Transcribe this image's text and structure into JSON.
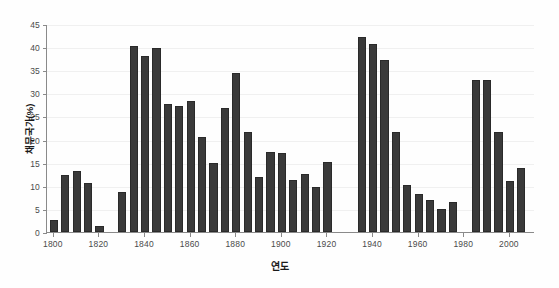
{
  "chart_data": {
    "type": "bar",
    "title": "",
    "xlabel": "연도",
    "ylabel": "채무국가(%)",
    "xlim": [
      1797,
      2011
    ],
    "ylim": [
      0,
      45
    ],
    "ytick_values": [
      0,
      5,
      10,
      15,
      20,
      25,
      30,
      35,
      40,
      45
    ],
    "ytick_labels": [
      "0",
      "5",
      "10",
      "15",
      "20",
      "25",
      "30",
      "35",
      "40",
      "45"
    ],
    "xtick_values": [
      1800,
      1820,
      1840,
      1860,
      1880,
      1900,
      1920,
      1940,
      1960,
      1980,
      2000
    ],
    "xtick_labels": [
      "1800",
      "1820",
      "1840",
      "1860",
      "1880",
      "1900",
      "1920",
      "1940",
      "1960",
      "1980",
      "2000"
    ],
    "grid": "horizontal",
    "legend": "none",
    "bar_color": "#3a3a3a",
    "x": [
      1800,
      1805,
      1810,
      1815,
      1820,
      1825,
      1830,
      1835,
      1840,
      1845,
      1850,
      1855,
      1860,
      1865,
      1870,
      1875,
      1880,
      1885,
      1890,
      1895,
      1900,
      1905,
      1910,
      1915,
      1920,
      1925,
      1930,
      1935,
      1940,
      1945,
      1950,
      1955,
      1960,
      1965,
      1970,
      1975,
      1980,
      1985,
      1990,
      1995,
      2000,
      2005,
      2008
    ],
    "values": [
      2.6,
      12.4,
      13.3,
      10.6,
      1.2,
      0,
      8.7,
      40.2,
      38.0,
      39.8,
      27.8,
      27.2,
      28.4,
      20.5,
      14.9,
      26.9,
      34.4,
      21.7,
      12.0,
      17.3,
      17.2,
      11.2,
      12.6,
      9.8,
      15.2,
      0,
      0,
      42.2,
      40.6,
      37.2,
      21.7,
      10.2,
      8.2,
      7.0,
      5.0,
      6.5,
      0,
      32.8,
      32.9,
      21.7,
      11.1,
      13.8,
      0
    ],
    "categories": [
      "1800",
      "1805",
      "1810",
      "1815",
      "1820",
      "1825",
      "1830",
      "1835",
      "1840",
      "1845",
      "1850",
      "1855",
      "1860",
      "1865",
      "1870",
      "1875",
      "1880",
      "1885",
      "1890",
      "1895",
      "1900",
      "1905",
      "1910",
      "1915",
      "1920",
      "1925",
      "1930",
      "1935",
      "1940",
      "1945",
      "1950",
      "1955",
      "1960",
      "1965",
      "1970",
      "1975",
      "1980",
      "1985",
      "1990",
      "1995",
      "2000",
      "2005",
      "2008"
    ]
  }
}
